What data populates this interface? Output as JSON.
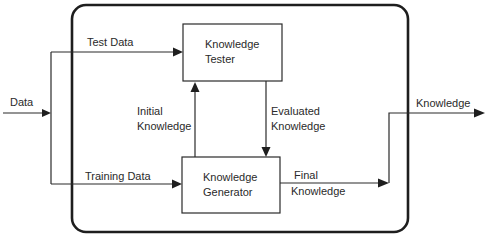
{
  "diagram": {
    "container": {
      "label": ""
    },
    "blocks": {
      "tester": {
        "line1": "Knowledge",
        "line2": "Tester"
      },
      "generator": {
        "line1": "Knowledge",
        "line2": "Generator"
      }
    },
    "edges": {
      "data_in": {
        "label": "Data"
      },
      "test_data": {
        "label": "Test Data"
      },
      "training_data": {
        "label": "Training Data"
      },
      "initial_knowledge": {
        "line1": "Initial",
        "line2": "Knowledge"
      },
      "evaluated_knowledge": {
        "line1": "Evaluated",
        "line2": "Knowledge"
      },
      "final_knowledge": {
        "line1": "Final",
        "line2": "Knowledge"
      },
      "knowledge_out": {
        "label": "Knowledge"
      }
    },
    "colors": {
      "stroke": "#2a2a2a",
      "background": "#ffffff"
    }
  }
}
